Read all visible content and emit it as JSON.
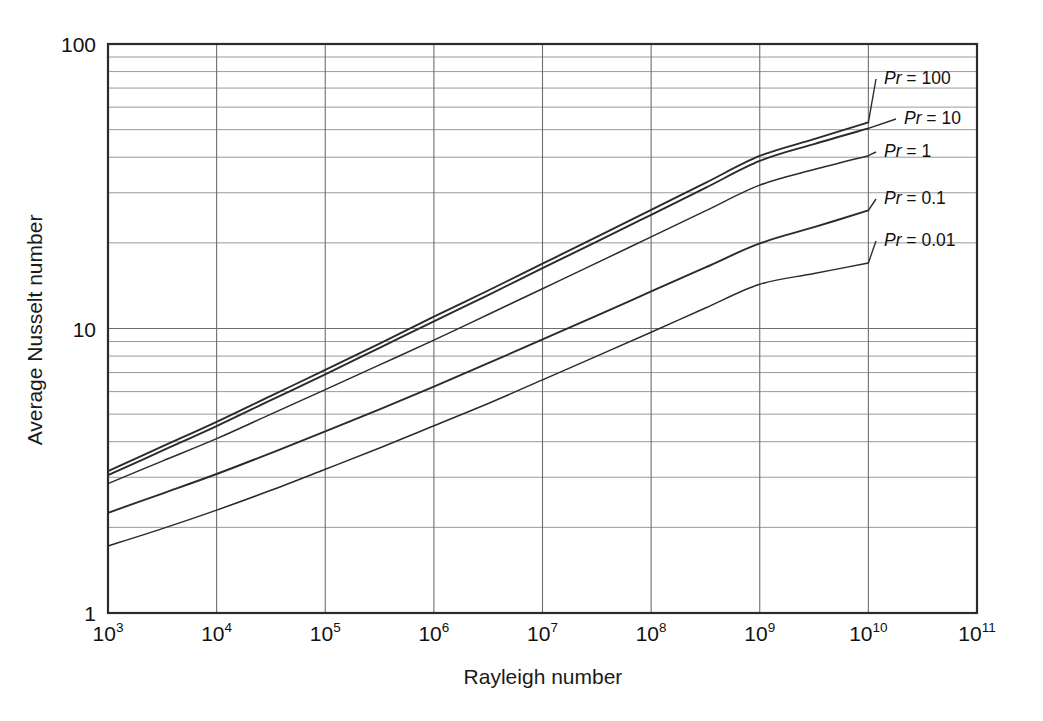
{
  "chart_data": {
    "type": "line",
    "title": "",
    "xlabel": "Rayleigh number",
    "ylabel": "Average Nusselt number",
    "xscale": "log",
    "yscale": "log",
    "xlim": [
      1000,
      100000000000
    ],
    "ylim": [
      1,
      100
    ],
    "grid": true,
    "legend_position": "inline-right-labels",
    "x_tick_labels": [
      "10³",
      "10⁴",
      "10⁵",
      "10⁶",
      "10⁷",
      "10⁸",
      "10⁹",
      "10¹⁰",
      "10¹¹"
    ],
    "x_tick_bases": [
      "10",
      "10",
      "10",
      "10",
      "10",
      "10",
      "10",
      "10",
      "10"
    ],
    "x_tick_exps": [
      "3",
      "4",
      "5",
      "6",
      "7",
      "8",
      "9",
      "10",
      "11"
    ],
    "x_tick_values": [
      1000,
      10000,
      100000,
      1000000,
      10000000,
      100000000,
      1000000000,
      10000000000,
      100000000000
    ],
    "y_tick_labels": [
      "1",
      "10",
      "100"
    ],
    "y_tick_values": [
      1,
      10,
      100
    ],
    "y_minor_ticks": [
      2,
      3,
      4,
      5,
      6,
      7,
      8,
      9,
      20,
      30,
      40,
      50,
      60,
      70,
      80,
      90
    ],
    "series": [
      {
        "name": "Pr = 100",
        "label": "Pr = 100",
        "label_prefix": "Pr",
        "label_suffix": " = 100",
        "pr_value": 100,
        "color": "#2b2b2b",
        "line_width": 1.9,
        "x": [
          1000,
          3162,
          10000,
          31620,
          100000,
          316200,
          1000000,
          3162000,
          10000000,
          31620000,
          100000000,
          316200000,
          1000000000,
          3162000000,
          10000000000
        ],
        "y": [
          3.15,
          3.85,
          4.7,
          5.8,
          7.15,
          8.85,
          11.0,
          13.6,
          16.9,
          21.0,
          26.1,
          32.5,
          40.4,
          46.3,
          53.0
        ]
      },
      {
        "name": "Pr = 10",
        "label": "Pr = 10",
        "label_prefix": "Pr",
        "label_suffix": " = 10",
        "pr_value": 10,
        "color": "#2b2b2b",
        "line_width": 1.9,
        "x": [
          1000,
          3162,
          10000,
          31620,
          100000,
          316200,
          1000000,
          3162000,
          10000000,
          31620000,
          100000000,
          316200000,
          1000000000,
          3162000000,
          10000000000
        ],
        "y": [
          3.05,
          3.72,
          4.54,
          5.6,
          6.9,
          8.55,
          10.6,
          13.1,
          16.3,
          20.2,
          25.1,
          31.2,
          38.8,
          44.5,
          50.5
        ]
      },
      {
        "name": "Pr = 1",
        "label": "Pr = 1",
        "label_prefix": "Pr",
        "label_suffix": " = 1",
        "pr_value": 1,
        "color": "#3a3a3a",
        "line_width": 1.5,
        "x": [
          1000,
          3162,
          10000,
          31620,
          100000,
          316200,
          1000000,
          3162000,
          10000000,
          31620000,
          100000000,
          316200000,
          1000000000,
          3162000000,
          10000000000
        ],
        "y": [
          2.85,
          3.42,
          4.1,
          5.0,
          6.1,
          7.45,
          9.1,
          11.2,
          13.8,
          17.0,
          21.0,
          25.9,
          31.9,
          36.2,
          40.5
        ]
      },
      {
        "name": "Pr = 0.1",
        "label": "Pr = 0.1",
        "label_prefix": "Pr",
        "label_suffix": " = 0.1",
        "pr_value": 0.1,
        "color": "#2b2b2b",
        "line_width": 1.9,
        "x": [
          1000,
          3162,
          10000,
          31620,
          100000,
          316200,
          1000000,
          3162000,
          10000000,
          31620000,
          100000000,
          316200000,
          1000000000,
          3162000000,
          10000000000
        ],
        "y": [
          2.25,
          2.63,
          3.08,
          3.65,
          4.35,
          5.2,
          6.25,
          7.55,
          9.15,
          11.1,
          13.5,
          16.4,
          19.9,
          22.7,
          26.0
        ]
      },
      {
        "name": "Pr = 0.01",
        "label": "Pr = 0.01",
        "label_prefix": "Pr",
        "label_suffix": " = 0.01",
        "pr_value": 0.01,
        "color": "#4a4a4a",
        "line_width": 1.5,
        "x": [
          1000,
          3162,
          10000,
          31620,
          100000,
          316200,
          1000000,
          3162000,
          10000000,
          31620000,
          100000000,
          316200000,
          1000000000,
          3162000000,
          10000000000
        ],
        "y": [
          1.72,
          1.98,
          2.3,
          2.7,
          3.2,
          3.8,
          4.55,
          5.45,
          6.6,
          8.0,
          9.7,
          11.8,
          14.3,
          15.6,
          17.0
        ]
      }
    ],
    "series_label_positions": [
      {
        "name": "Pr = 100",
        "x": 884,
        "y": 84
      },
      {
        "name": "Pr = 10",
        "x": 904,
        "y": 124
      },
      {
        "name": "Pr = 1",
        "x": 884,
        "y": 157
      },
      {
        "name": "Pr = 0.1",
        "x": 884,
        "y": 204
      },
      {
        "name": "Pr = 0.01",
        "x": 884,
        "y": 246
      }
    ]
  },
  "axes": {
    "x_title": "Rayleigh number",
    "y_title": "Average Nusselt number"
  }
}
